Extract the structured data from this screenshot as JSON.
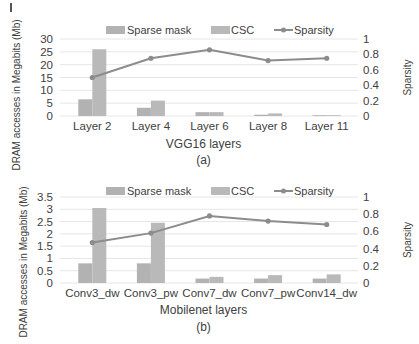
{
  "chart_data": [
    {
      "type": "bar",
      "subtitle": "(a)",
      "xlabel": "VGG16 layers",
      "ylabel": "DRAM accesses in Megabits (Mb)",
      "y2label": "Sparsity",
      "ylim": [
        0,
        30
      ],
      "y2lim": [
        0,
        1
      ],
      "yticks": [
        "0",
        "5",
        "10",
        "15",
        "20",
        "25",
        "30"
      ],
      "y2ticks": [
        "0",
        "0.2",
        "0.4",
        "0.6",
        "0.8",
        "1"
      ],
      "grid": true,
      "legend_position": "top",
      "categories": [
        "Layer 2",
        "Layer 4",
        "Layer 6",
        "Layer 8",
        "Layer 11"
      ],
      "series": [
        {
          "name": "Sparse mask",
          "type": "bar",
          "axis": "left",
          "color": "#b0b0b0",
          "values": [
            6.5,
            3.2,
            1.5,
            0.5,
            0.2
          ]
        },
        {
          "name": "CSC",
          "type": "bar",
          "axis": "left",
          "color": "#b8b8b8",
          "values": [
            26,
            6,
            1.5,
            1.0,
            0.2
          ]
        },
        {
          "name": "Sparsity",
          "type": "line",
          "axis": "right",
          "color": "#8a8a8a",
          "values": [
            0.5,
            0.75,
            0.86,
            0.72,
            0.75
          ]
        }
      ]
    },
    {
      "type": "bar",
      "subtitle": "(b)",
      "xlabel": "Mobilenet layers",
      "ylabel": "DRAM accesses in Megabits (Mb)",
      "y2label": "Sparsity",
      "ylim": [
        0,
        3.5
      ],
      "y2lim": [
        0,
        1
      ],
      "yticks": [
        "0",
        "0.5",
        "1",
        "1.5",
        "2",
        "2.5",
        "3",
        "3.5"
      ],
      "y2ticks": [
        "0",
        "0.2",
        "0.4",
        "0.6",
        "0.8",
        "1"
      ],
      "grid": true,
      "legend_position": "top",
      "categories": [
        "Conv3_dw",
        "Conv3_pw",
        "Conv7_dw",
        "Conv7_pw",
        "Conv14_dw"
      ],
      "series": [
        {
          "name": "Sparse mask",
          "type": "bar",
          "axis": "left",
          "color": "#b0b0b0",
          "values": [
            0.8,
            0.8,
            0.18,
            0.18,
            0.18
          ]
        },
        {
          "name": "CSC",
          "type": "bar",
          "axis": "left",
          "color": "#b8b8b8",
          "values": [
            3.05,
            2.45,
            0.25,
            0.32,
            0.35
          ]
        },
        {
          "name": "Sparsity",
          "type": "line",
          "axis": "right",
          "color": "#8a8a8a",
          "values": [
            0.47,
            0.58,
            0.78,
            0.72,
            0.68
          ]
        }
      ]
    }
  ],
  "layout": [
    {
      "plot_left": 55,
      "plot_right": 358,
      "y_zero": 116,
      "y_top": 39,
      "legend_y": 30,
      "xtick_y": 130,
      "xtitle_y": 148,
      "subtitle_y": 164,
      "ylabel_cx": 20,
      "ylabel_cy": 95
    },
    {
      "plot_left": 55,
      "plot_right": 358,
      "y_zero": 283,
      "y_top": 197,
      "legend_y": 191,
      "xtick_y": 297,
      "xtitle_y": 314,
      "subtitle_y": 331,
      "ylabel_cx": 27,
      "ylabel_cy": 262
    }
  ],
  "colors": {
    "bar": "#b3b3b3",
    "line": "#8c8c8c",
    "grid": "#e6e6e6",
    "text": "#404040"
  }
}
